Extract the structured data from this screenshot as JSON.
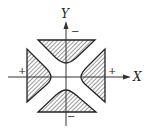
{
  "diagram": {
    "type": "region-sign-diagram",
    "axes": {
      "x_label": "X",
      "y_label": "Y"
    },
    "regions": [
      {
        "name": "top",
        "sign": "−",
        "shaded": true
      },
      {
        "name": "bottom",
        "sign": "−",
        "shaded": true
      },
      {
        "name": "left",
        "sign": "+",
        "shaded": true
      },
      {
        "name": "right",
        "sign": "+",
        "shaded": true
      }
    ],
    "colors": {
      "stroke": "#222222",
      "hatch": "#333333",
      "background": "#ffffff"
    }
  }
}
